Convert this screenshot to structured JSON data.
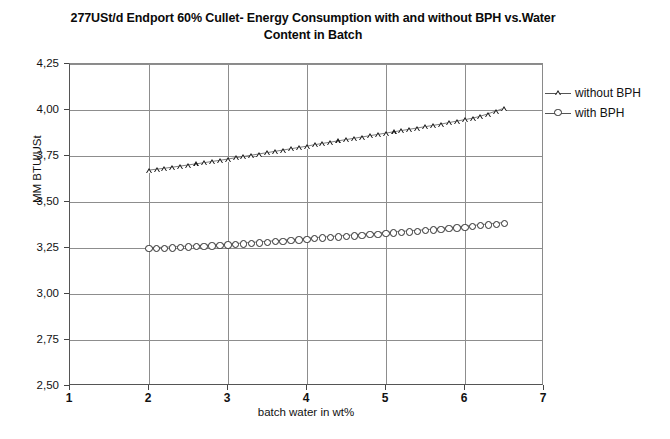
{
  "chart_data": {
    "type": "scatter",
    "title": "277USt/d Endport 60% Cullet- Energy Consumption with and without BPH vs.Water Content in Batch",
    "xlabel": "batch water in wt%",
    "ylabel": "MM BTU/USt",
    "xlim": [
      1,
      7
    ],
    "ylim": [
      2.5,
      4.25
    ],
    "xticks": [
      "1",
      "2",
      "3",
      "4",
      "5",
      "6",
      "7"
    ],
    "xtick_values": [
      1,
      2,
      3,
      4,
      5,
      6,
      7
    ],
    "yticks": [
      "2,50",
      "2,75",
      "3,00",
      "3,25",
      "3,50",
      "3,75",
      "4,00",
      "4,25"
    ],
    "ytick_values": [
      2.5,
      2.75,
      3.0,
      3.25,
      3.5,
      3.75,
      4.0,
      4.25
    ],
    "grid": true,
    "legend_position": "right",
    "decimal_separator": ",",
    "series": [
      {
        "name": "without BPH",
        "marker": "triangle-open",
        "color": "#1a1a1a",
        "x": [
          2.0,
          2.1,
          2.2,
          2.3,
          2.4,
          2.5,
          2.6,
          2.7,
          2.8,
          2.9,
          3.0,
          3.1,
          3.2,
          3.3,
          3.4,
          3.5,
          3.6,
          3.7,
          3.8,
          3.9,
          4.0,
          4.1,
          4.2,
          4.3,
          4.4,
          4.5,
          4.6,
          4.7,
          4.8,
          4.9,
          5.0,
          5.1,
          5.2,
          5.3,
          5.4,
          5.5,
          5.6,
          5.7,
          5.8,
          5.9,
          6.0,
          6.1,
          6.2,
          6.3,
          6.4,
          6.5
        ],
        "values": [
          3.67,
          3.675,
          3.68,
          3.686,
          3.692,
          3.698,
          3.704,
          3.71,
          3.717,
          3.723,
          3.73,
          3.737,
          3.744,
          3.751,
          3.758,
          3.765,
          3.772,
          3.779,
          3.786,
          3.793,
          3.8,
          3.808,
          3.815,
          3.822,
          3.829,
          3.836,
          3.843,
          3.85,
          3.857,
          3.864,
          3.871,
          3.878,
          3.885,
          3.892,
          3.899,
          3.906,
          3.913,
          3.92,
          3.928,
          3.936,
          3.944,
          3.952,
          3.962,
          3.975,
          3.99,
          4.005
        ]
      },
      {
        "name": "with BPH",
        "marker": "circle-open",
        "color": "#2a2a2a",
        "x": [
          2.0,
          2.1,
          2.2,
          2.3,
          2.4,
          2.5,
          2.6,
          2.7,
          2.8,
          2.9,
          3.0,
          3.1,
          3.2,
          3.3,
          3.4,
          3.5,
          3.6,
          3.7,
          3.8,
          3.9,
          4.0,
          4.1,
          4.2,
          4.3,
          4.4,
          4.5,
          4.6,
          4.7,
          4.8,
          4.9,
          5.0,
          5.1,
          5.2,
          5.3,
          5.4,
          5.5,
          5.6,
          5.7,
          5.8,
          5.9,
          6.0,
          6.1,
          6.2,
          6.3,
          6.4,
          6.5
        ],
        "values": [
          3.245,
          3.246,
          3.248,
          3.25,
          3.252,
          3.254,
          3.256,
          3.258,
          3.26,
          3.262,
          3.265,
          3.268,
          3.271,
          3.274,
          3.277,
          3.28,
          3.283,
          3.286,
          3.289,
          3.292,
          3.296,
          3.3,
          3.303,
          3.306,
          3.309,
          3.312,
          3.315,
          3.318,
          3.321,
          3.324,
          3.328,
          3.331,
          3.334,
          3.337,
          3.34,
          3.343,
          3.346,
          3.35,
          3.354,
          3.358,
          3.362,
          3.366,
          3.37,
          3.374,
          3.378,
          3.382
        ]
      }
    ]
  }
}
